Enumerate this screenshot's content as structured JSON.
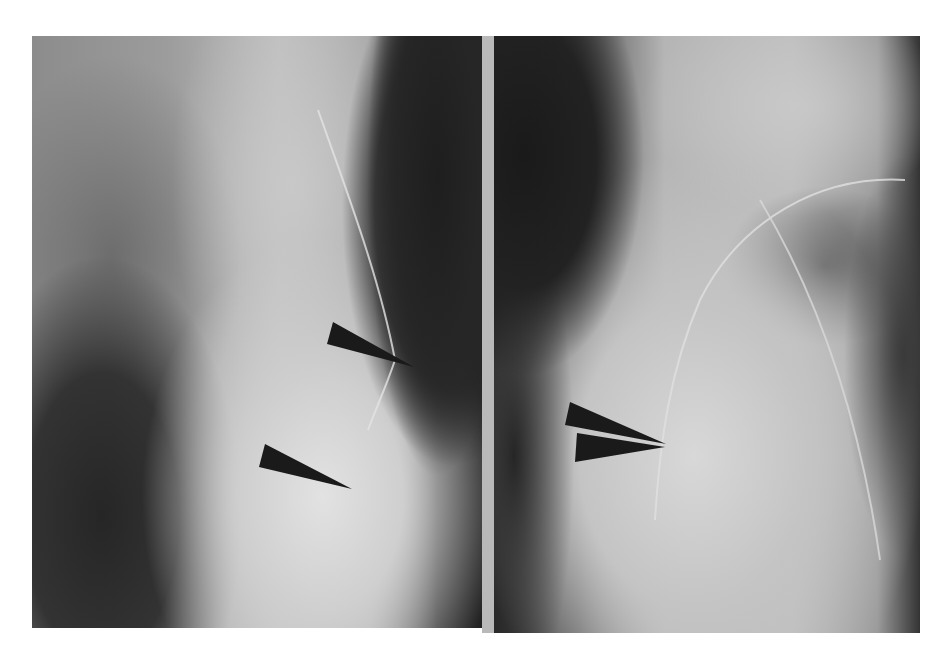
{
  "figure": {
    "type": "radiograph-pair",
    "background": "#ffffff",
    "divider_color": "#b9b9b9",
    "panels": [
      {
        "id": "left",
        "label": "",
        "x": 32,
        "y": 36,
        "width": 450,
        "height": 592
      },
      {
        "id": "right",
        "label": "",
        "x": 494,
        "y": 36,
        "width": 426,
        "height": 597
      }
    ],
    "arrowheads": [
      {
        "panel": "left",
        "points": "333,322 327,344 414,367",
        "color": "#1a1a1a"
      },
      {
        "panel": "left",
        "points": "265,444 259,467 352,489",
        "color": "#1a1a1a"
      },
      {
        "panel": "right",
        "points": "570,402 565,425 666,444",
        "color": "#1a1a1a"
      },
      {
        "panel": "right",
        "points": "577,433 575,462 665,447",
        "color": "#1a1a1a"
      }
    ],
    "catheter_lines": [
      {
        "panel": "left",
        "d": "M318,110 C350,200 380,280 395,360 C385,390 375,410 368,430",
        "color": "#e4e4e4"
      },
      {
        "panel": "right",
        "d": "M905,180 C820,175 740,220 700,300 C670,370 660,440 655,520",
        "color": "#e0e0e0"
      },
      {
        "panel": "right",
        "d": "M760,200 C820,300 860,420 880,560",
        "color": "#d8d8d8"
      }
    ]
  }
}
